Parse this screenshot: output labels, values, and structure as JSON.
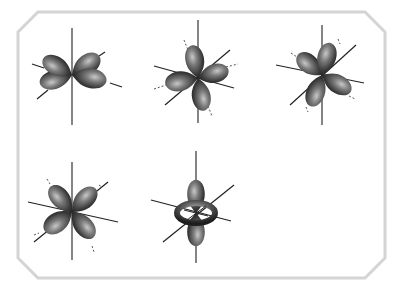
{
  "figure": {
    "frame_color": "#d4d4d4",
    "lobe_color_dark": "#2e2e2e",
    "lobe_color_mid": "#6a6a6a",
    "lobe_color_light": "#bdbdbd",
    "axis_color": "#222222",
    "orbitals": [
      {
        "id": "d-orbital-1",
        "shape": "four-lobe-in-plane-between-axes",
        "position": "top-left"
      },
      {
        "id": "d-orbital-2",
        "shape": "four-lobe-cloverleaf",
        "position": "top-middle"
      },
      {
        "id": "d-orbital-3",
        "shape": "four-lobe-diagonal",
        "position": "top-right"
      },
      {
        "id": "d-orbital-4",
        "shape": "four-lobe-diagonal",
        "position": "bottom-left"
      },
      {
        "id": "d-orbital-5",
        "shape": "dumbbell-with-torus",
        "position": "bottom-middle"
      }
    ]
  }
}
